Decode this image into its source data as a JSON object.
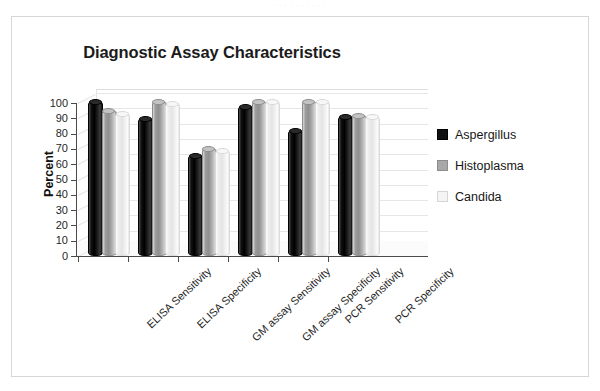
{
  "artifact": {
    "top_text": "·  ·  ·   ·   ·  ·   ·   ·    ·    ·"
  },
  "figure": {
    "title": "Diagnostic Assay Characteristics"
  },
  "legend": {
    "position": "right",
    "items": [
      {
        "label": "Aspergillus",
        "color": "#101010",
        "key": "aspergillus"
      },
      {
        "label": "Histoplasma",
        "color": "#a8a8a8",
        "key": "histoplasma"
      },
      {
        "label": "Candida",
        "color": "#f4f4f4",
        "key": "candida"
      }
    ]
  },
  "chart_data": {
    "type": "bar",
    "title": "Diagnostic Assay Characteristics",
    "xlabel": "",
    "ylabel": "Percent",
    "ylim": [
      0,
      100
    ],
    "yticks": [
      0,
      10,
      20,
      30,
      40,
      50,
      60,
      70,
      80,
      90,
      100
    ],
    "ytick_labels": [
      "0",
      "10",
      "20",
      "30",
      "40",
      "50",
      "60",
      "70",
      "80",
      "90",
      "100"
    ],
    "grid": true,
    "legend_position": "right",
    "categories": [
      "ELISA Sensitivity",
      "ELISA Specificity",
      "GM assay Sensitivity",
      "GM assay Specificity",
      "PCR Sensitivity",
      "PCR Specificity"
    ],
    "series": [
      {
        "name": "Aspergillus",
        "color": "#101010",
        "values": [
          100,
          89,
          65,
          97,
          81,
          90
        ]
      },
      {
        "name": "Histoplasma",
        "color": "#a8a8a8",
        "values": [
          94,
          100,
          69,
          100,
          100,
          91
        ]
      },
      {
        "name": "Candida",
        "color": "#f4f4f4",
        "values": [
          92,
          99,
          68,
          100,
          100,
          90
        ]
      }
    ]
  }
}
